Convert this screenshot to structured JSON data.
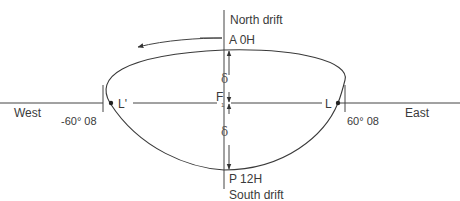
{
  "diagram": {
    "labels": {
      "north": "North drift",
      "south": "South drift",
      "west": "West",
      "east": "East",
      "top_point": "A 0H",
      "bottom_point": "P 12H",
      "left_point": "L'",
      "right_point": "L",
      "center_point": "F",
      "center_sub": "1",
      "delta_upper": "δ",
      "delta_lower": "δ",
      "left_angle": "-60° 08",
      "right_angle": "60° 08"
    },
    "colors": {
      "line": "#444444",
      "text": "#3a3a3a",
      "background": "#ffffff"
    }
  }
}
